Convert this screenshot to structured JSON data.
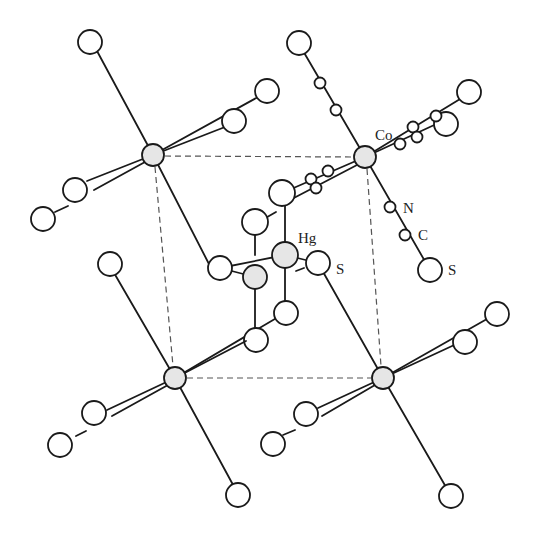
{
  "figure": {
    "type": "crystal-structure",
    "labels": {
      "cobalt": "Co",
      "mercury": "Hg",
      "sulfur_near_hg": "S",
      "nitrogen": "N",
      "carbon": "C",
      "sulfur_terminal": "S"
    },
    "colors": {
      "line": "#1a1a1a",
      "cell_edge": "#555555",
      "metal_fill": "#e6e6e6",
      "atom_fill": "#ffffff"
    },
    "unit_cell": {
      "corners": [
        {
          "name": "co-top-left",
          "x": 153,
          "y": 155
        },
        {
          "name": "co-top-right",
          "x": 365,
          "y": 157
        },
        {
          "name": "co-bottom-left",
          "x": 175,
          "y": 378
        },
        {
          "name": "co-bottom-right",
          "x": 383,
          "y": 378
        }
      ]
    }
  }
}
